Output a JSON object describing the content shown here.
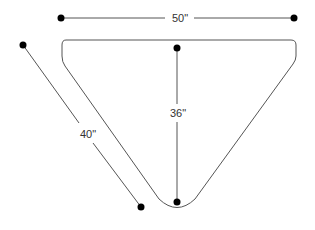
{
  "diagram": {
    "colors": {
      "line": "#555555",
      "outline": "#555555",
      "dot": "#000000",
      "text": "#333333",
      "background": "#ffffff"
    },
    "dimensions": {
      "width": {
        "label": "50\"",
        "x1": 61,
        "y1": 18,
        "x2": 294,
        "y2": 18,
        "label_x": 180,
        "label_y": 22
      },
      "depth": {
        "label": "36\"",
        "x1": 177,
        "y1": 48,
        "x2": 177,
        "y2": 202,
        "label_x": 178,
        "label_y": 117
      },
      "side": {
        "label": "40\"",
        "x1": 23,
        "y1": 45,
        "x2": 141,
        "y2": 207,
        "label_x": 88,
        "label_y": 138
      }
    }
  }
}
